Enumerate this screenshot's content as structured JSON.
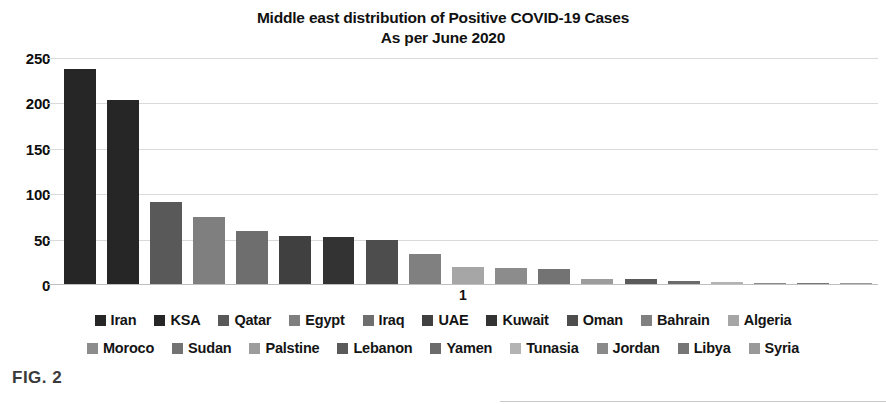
{
  "chart_data": {
    "type": "bar",
    "title": "Middle east distribution of Positive COVID-19 Cases",
    "subtitle": "As per June 2020",
    "xlabel": "1",
    "ylabel": "",
    "ylim": [
      0,
      250
    ],
    "yticks": [
      0,
      50,
      100,
      150,
      200,
      250
    ],
    "ytick_labels": [
      "0",
      "50",
      "100",
      "150",
      "200",
      "250"
    ],
    "grid": true,
    "legend_position": "bottom",
    "categories": [
      "Iran",
      "KSA",
      "Qatar",
      "Egypt",
      "Iraq",
      "UAE",
      "Kuwait",
      "Oman",
      "Bahrain",
      "Algeria",
      "Moroco",
      "Sudan",
      "Palstine",
      "Lebanon",
      "Yamen",
      "Tunasia",
      "Jordan",
      "Libya",
      "Syria"
    ],
    "values": [
      237,
      203,
      90,
      74,
      58,
      53,
      52,
      48,
      33,
      19,
      18,
      16,
      6,
      5,
      3,
      2,
      1,
      1,
      1
    ],
    "colors": [
      "#262626",
      "#262626",
      "#595959",
      "#7f7f7f",
      "#6e6e6e",
      "#404040",
      "#333333",
      "#4d4d4d",
      "#808080",
      "#a6a6a6",
      "#8c8c8c",
      "#737373",
      "#9c9c9c",
      "#5a5a5a",
      "#6b6b6b",
      "#b3b3b3",
      "#8a8a8a",
      "#767676",
      "#999999"
    ]
  },
  "legend": {
    "row1": [
      {
        "label": "Iran",
        "color": "#262626"
      },
      {
        "label": "KSA",
        "color": "#262626"
      },
      {
        "label": "Qatar",
        "color": "#595959"
      },
      {
        "label": "Egypt",
        "color": "#7f7f7f"
      },
      {
        "label": "Iraq",
        "color": "#6e6e6e"
      },
      {
        "label": "UAE",
        "color": "#404040"
      },
      {
        "label": "Kuwait",
        "color": "#333333"
      },
      {
        "label": "Oman",
        "color": "#4d4d4d"
      },
      {
        "label": "Bahrain",
        "color": "#808080"
      },
      {
        "label": "Algeria",
        "color": "#a6a6a6"
      }
    ],
    "row2": [
      {
        "label": "Moroco",
        "color": "#8c8c8c"
      },
      {
        "label": "Sudan",
        "color": "#737373"
      },
      {
        "label": "Palstine",
        "color": "#9c9c9c"
      },
      {
        "label": "Lebanon",
        "color": "#5a5a5a"
      },
      {
        "label": "Yamen",
        "color": "#6b6b6b"
      },
      {
        "label": "Tunasia",
        "color": "#b3b3b3"
      },
      {
        "label": "Jordan",
        "color": "#8a8a8a"
      },
      {
        "label": "Libya",
        "color": "#767676"
      },
      {
        "label": "Syria",
        "color": "#999999"
      }
    ]
  },
  "figure": {
    "caption": "FIG. 2"
  }
}
